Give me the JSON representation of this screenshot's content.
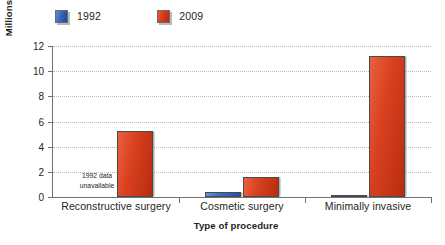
{
  "chart_data": {
    "type": "bar",
    "title": "",
    "subtitle": "",
    "xlabel": "Type of procedure",
    "ylabel": "Millions of procedures",
    "categories": [
      "Reconstructive surgery",
      "Cosmetic surgery",
      "Minimally invasive"
    ],
    "series": [
      {
        "name": "1992",
        "color": "#3a6fc4",
        "values": [
          null,
          0.4,
          0.1
        ]
      },
      {
        "name": "2009",
        "color": "#d8411f",
        "values": [
          5.25,
          1.6,
          11.2
        ]
      }
    ],
    "ylim": [
      0,
      12
    ],
    "yticks": [
      0,
      2,
      4,
      6,
      8,
      10,
      12
    ],
    "ytick_labels": [
      "0",
      "2",
      "4",
      "6",
      "8",
      "10",
      "12"
    ],
    "grid": true,
    "legend_position": "top-left",
    "annotations": [
      {
        "name": "missing-data-note",
        "lines": [
          "1992 data",
          "unavailable"
        ],
        "category": "Reconstructive surgery",
        "series": "1992"
      }
    ]
  },
  "legend": {
    "items": [
      {
        "label": "1992",
        "swatch": "blue-swatch-icon"
      },
      {
        "label": "2009",
        "swatch": "red-swatch-icon"
      }
    ]
  },
  "axes": {
    "y_title": "Millions of procedures",
    "x_title": "Type of procedure",
    "y_labels": [
      "12",
      "10",
      "8",
      "6",
      "4",
      "2",
      "0"
    ],
    "x_labels": [
      "Reconstructive surgery",
      "Cosmetic surgery",
      "Minimally invasive"
    ]
  },
  "annotation": {
    "line1": "1992 data",
    "line2": "unavailable"
  },
  "colors": {
    "series_1992": "#3a6fc4",
    "series_2009": "#d8411f",
    "axis": "#6f7072",
    "grid": "#b9bcc4",
    "text": "#231f20",
    "background": "#ffffff"
  }
}
